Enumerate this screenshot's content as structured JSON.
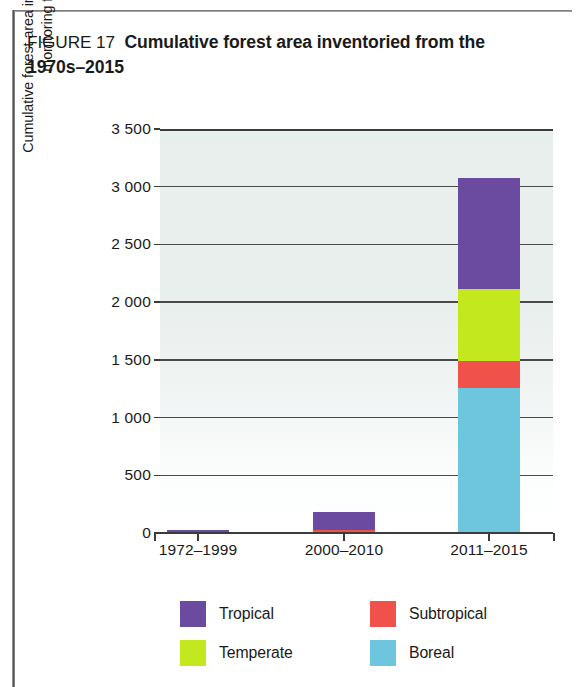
{
  "figure": {
    "label": "FIGURE 17",
    "title": "Cumulative forest area inventoried from the 1970s–2015"
  },
  "chart_data": {
    "type": "bar",
    "subtype": "stacked-vertical",
    "title": "Cumulative forest area inventoried from the 1970s–2015",
    "xlabel": "",
    "ylabel": "Cumulative forest area inventoried in the most recent forest monitoring framework (million ha)",
    "categories": [
      "1972–1999",
      "2000–2010",
      "2011–2015"
    ],
    "ylim": [
      0,
      3500
    ],
    "ytick_values": [
      0,
      500,
      1000,
      1500,
      2000,
      2500,
      3000,
      3500
    ],
    "ytick_labels": [
      "0",
      "500",
      "1 000",
      "1 500",
      "2 000",
      "2 500",
      "3 000",
      "3 500"
    ],
    "grid": true,
    "legend_position": "bottom",
    "stack_order_bottom_to_top": [
      "Boreal",
      "Subtropical",
      "Temperate",
      "Tropical"
    ],
    "series": [
      {
        "name": "Boreal",
        "color": "#6dc6de",
        "values": [
          0,
          0,
          1260
        ]
      },
      {
        "name": "Subtropical",
        "color": "#f0524b",
        "values": [
          0,
          25,
          230
        ]
      },
      {
        "name": "Temperate",
        "color": "#c4e81e",
        "values": [
          0,
          0,
          620
        ]
      },
      {
        "name": "Tropical",
        "color": "#6b4ba0",
        "values": [
          25,
          155,
          970
        ]
      }
    ],
    "totals": [
      25,
      180,
      3080
    ]
  },
  "legend": {
    "items": [
      {
        "label": "Tropical",
        "color": "#6b4ba0"
      },
      {
        "label": "Subtropical",
        "color": "#f0524b"
      },
      {
        "label": "Temperate",
        "color": "#c4e81e"
      },
      {
        "label": "Boreal",
        "color": "#6dc6de"
      }
    ]
  }
}
